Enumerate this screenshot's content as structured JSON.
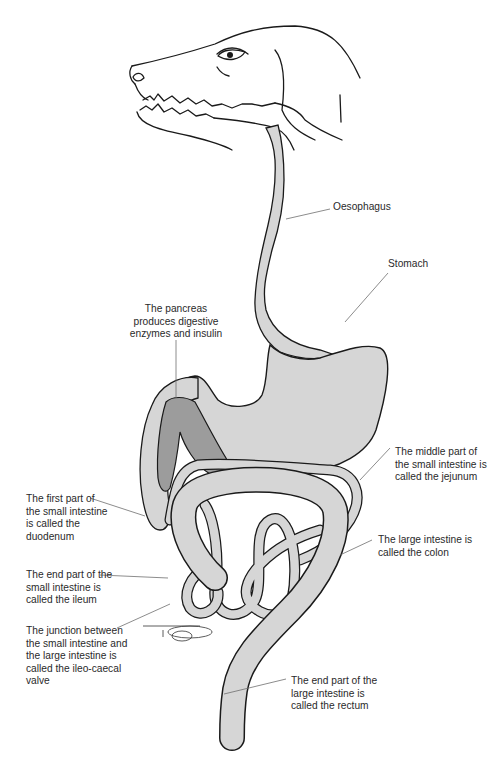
{
  "diagram": {
    "colors": {
      "organ_fill": "#d6d6d6",
      "pancreas_fill": "#9c9c9c",
      "outline": "#1a1a1a",
      "leader_line": "#6e6e6e",
      "text": "#2a2a2a"
    },
    "labels": {
      "oesophagus": "Oesophagus",
      "stomach": "Stomach",
      "pancreas": "The pancreas\nproduces digestive\nenzymes and insulin",
      "duodenum": "The first part of\nthe small intestine\nis called the\nduodenum",
      "jejunum": "The middle part of\nthe small intestine is\ncalled the jejunum",
      "colon": "The large intestine is\ncalled the colon",
      "ileum": "The end part of the\nsmall intestine is\ncalled the ileum",
      "ileo_caecal": "The junction between\nthe small intestine and\nthe large intestine is\ncalled the ileo-caecal\nvalve",
      "rectum": "The end part of the\nlarge intestine is\ncalled the rectum"
    }
  }
}
